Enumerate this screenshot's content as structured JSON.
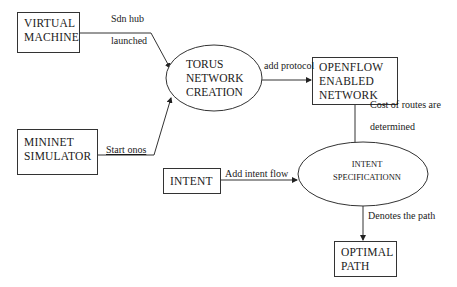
{
  "nodes": {
    "virtual_machine": {
      "lines": [
        "VIRTUAL",
        "MACHINE"
      ]
    },
    "mininet_simulator": {
      "lines": [
        "MININET",
        "SIMULATOR"
      ]
    },
    "torus_network_creation": {
      "lines": [
        "TORUS",
        "NETWORK",
        "CREATION"
      ]
    },
    "openflow_enabled_network": {
      "lines": [
        "OPENFLOW",
        "ENABLED",
        "NETWORK"
      ]
    },
    "intent": {
      "lines": [
        "INTENT"
      ]
    },
    "intent_specification": {
      "lines": [
        "INTENT",
        "SPECIFICATIONN"
      ]
    },
    "optimal_path": {
      "lines": [
        "OPTIMAL",
        "PATH"
      ]
    }
  },
  "edges": {
    "vm_to_torus": {
      "label_1": "Sdn hub",
      "label_2": "launched"
    },
    "mininet_to_torus": {
      "label": "Start onos"
    },
    "torus_to_openflow": {
      "label": "add protocol"
    },
    "openflow_to_intent_spec": {
      "label_1": "Cost of routes are",
      "label_2": "determined"
    },
    "intent_to_intent_spec": {
      "label": "Add intent flow"
    },
    "intent_spec_to_optimal": {
      "label": "Denotes the path"
    }
  },
  "colors": {
    "stroke": "#333333",
    "text": "#1a1a1a",
    "background": "#ffffff"
  }
}
